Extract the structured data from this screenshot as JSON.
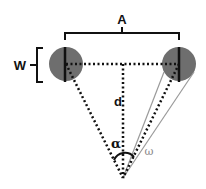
{
  "diagram": {
    "labels": {
      "A": "A",
      "W": "W",
      "d": "d",
      "alpha": "α",
      "omega": "ω"
    },
    "colors": {
      "circle_fill": "#6e6e6e",
      "line": "#111111",
      "thin_line": "#9a9a9a",
      "omega_label": "#8a8a8a",
      "background": "#ffffff"
    },
    "geometry": {
      "left_circle": {
        "cx": 66,
        "cy": 64,
        "r": 17
      },
      "right_circle": {
        "cx": 179,
        "cy": 64,
        "r": 17
      },
      "apex": {
        "x": 123,
        "y": 178
      }
    }
  }
}
